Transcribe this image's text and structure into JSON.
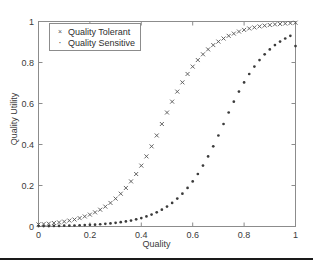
{
  "chart_data": {
    "type": "scatter",
    "title": "",
    "xlabel": "Quality",
    "ylabel": "Quality Utility",
    "xlim": [
      0,
      1
    ],
    "ylim": [
      0,
      1
    ],
    "xticks": [
      "0",
      "0.2",
      "0.4",
      "0.6",
      "0.8",
      "1"
    ],
    "xtick_values": [
      0,
      0.2,
      0.4,
      0.6,
      0.8,
      1
    ],
    "yticks": [
      "0",
      "0.2",
      "0.4",
      "0.6",
      "0.8",
      "1"
    ],
    "ytick_values": [
      0,
      0.2,
      0.4,
      0.6,
      0.8,
      1
    ],
    "grid": false,
    "legend_position": "top-left",
    "series": [
      {
        "name": "Quality Tolerant",
        "marker": "x",
        "color": "#555555",
        "x": [
          0.0,
          0.02,
          0.04,
          0.06,
          0.08,
          0.1,
          0.12,
          0.14,
          0.16,
          0.18,
          0.2,
          0.22,
          0.24,
          0.26,
          0.28,
          0.3,
          0.32,
          0.34,
          0.36,
          0.38,
          0.4,
          0.42,
          0.44,
          0.46,
          0.48,
          0.5,
          0.52,
          0.54,
          0.56,
          0.58,
          0.6,
          0.62,
          0.64,
          0.66,
          0.68,
          0.7,
          0.72,
          0.74,
          0.76,
          0.78,
          0.8,
          0.82,
          0.84,
          0.86,
          0.88,
          0.9,
          0.92,
          0.94,
          0.96,
          0.98,
          1.0
        ],
        "values": [
          0.01,
          0.012,
          0.014,
          0.017,
          0.02,
          0.024,
          0.029,
          0.034,
          0.041,
          0.049,
          0.058,
          0.069,
          0.082,
          0.097,
          0.115,
          0.136,
          0.16,
          0.188,
          0.22,
          0.256,
          0.297,
          0.342,
          0.391,
          0.444,
          0.5,
          0.556,
          0.609,
          0.658,
          0.703,
          0.744,
          0.78,
          0.812,
          0.84,
          0.864,
          0.885,
          0.902,
          0.917,
          0.93,
          0.941,
          0.951,
          0.959,
          0.966,
          0.971,
          0.976,
          0.98,
          0.983,
          0.986,
          0.988,
          0.99,
          0.992,
          0.994
        ]
      },
      {
        "name": "Quality Sensitive",
        "marker": "dot",
        "color": "#3b3b3b",
        "x": [
          0.0,
          0.02,
          0.04,
          0.06,
          0.08,
          0.1,
          0.12,
          0.14,
          0.16,
          0.18,
          0.2,
          0.22,
          0.24,
          0.26,
          0.28,
          0.3,
          0.32,
          0.34,
          0.36,
          0.38,
          0.4,
          0.42,
          0.44,
          0.46,
          0.48,
          0.5,
          0.52,
          0.54,
          0.56,
          0.58,
          0.6,
          0.62,
          0.64,
          0.66,
          0.68,
          0.7,
          0.72,
          0.74,
          0.76,
          0.78,
          0.8,
          0.82,
          0.84,
          0.86,
          0.88,
          0.9,
          0.92,
          0.94,
          0.96,
          0.98,
          1.0
        ],
        "values": [
          0.002,
          0.002,
          0.002,
          0.003,
          0.003,
          0.004,
          0.004,
          0.005,
          0.006,
          0.007,
          0.008,
          0.009,
          0.011,
          0.013,
          0.015,
          0.018,
          0.021,
          0.025,
          0.029,
          0.035,
          0.041,
          0.049,
          0.058,
          0.069,
          0.082,
          0.097,
          0.115,
          0.136,
          0.16,
          0.188,
          0.22,
          0.256,
          0.297,
          0.342,
          0.391,
          0.444,
          0.5,
          0.556,
          0.609,
          0.658,
          0.703,
          0.744,
          0.78,
          0.812,
          0.84,
          0.864,
          0.885,
          0.902,
          0.917,
          0.93,
          0.88
        ]
      }
    ]
  },
  "legend": {
    "items": [
      {
        "label": "Quality Tolerant",
        "glyph": "×"
      },
      {
        "label": "Quality Sensitive",
        "glyph": "·"
      }
    ]
  },
  "colors": {
    "axis": "#8c8c8c",
    "text": "#3a3a3a",
    "tolerant": "#555555",
    "sensitive": "#3b3b3b",
    "rule": "#1a1a1a"
  }
}
